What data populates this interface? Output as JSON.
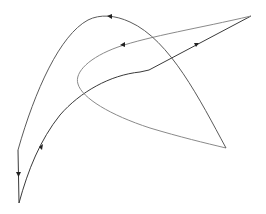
{
  "diagram": {
    "type": "closed-path-with-direction-arrows",
    "canvas": {
      "width": 266,
      "height": 214,
      "background": "#ffffff"
    },
    "colors": {
      "dark": "#3a3a3a",
      "mid": "#5a5a5a",
      "light": "#8a8a8a",
      "arrow": "#222222"
    },
    "vertices": {
      "bottom_left_tip": [
        19,
        203
      ],
      "left_vertical_top": [
        18,
        150
      ],
      "top_peak": [
        110,
        16
      ],
      "right_lower_tip": [
        226,
        148
      ],
      "upper_right_tip": [
        251,
        16
      ],
      "kink": [
        149,
        70
      ]
    },
    "segments": [
      {
        "name": "rising-curve",
        "from": "bottom_left_tip",
        "to": "kink",
        "arrow_direction": "up-right"
      },
      {
        "name": "straight-to-upper-right",
        "from": "kink",
        "to": "upper_right_tip",
        "arrow_direction": "up-right"
      },
      {
        "name": "return-to-inner-loop",
        "from": "upper_right_tip",
        "to": "inner-loop",
        "arrow_direction": "left"
      },
      {
        "name": "inner-loop-to-lower-right",
        "from": "inner-loop",
        "to": "right_lower_tip"
      },
      {
        "name": "outer-arc",
        "from": "right_lower_tip",
        "to": "left_vertical_top",
        "arrow_direction": "left-at-peak"
      },
      {
        "name": "left-vertical",
        "from": "left_vertical_top",
        "to": "bottom_left_tip",
        "arrow_direction": "down"
      }
    ],
    "labels": []
  }
}
